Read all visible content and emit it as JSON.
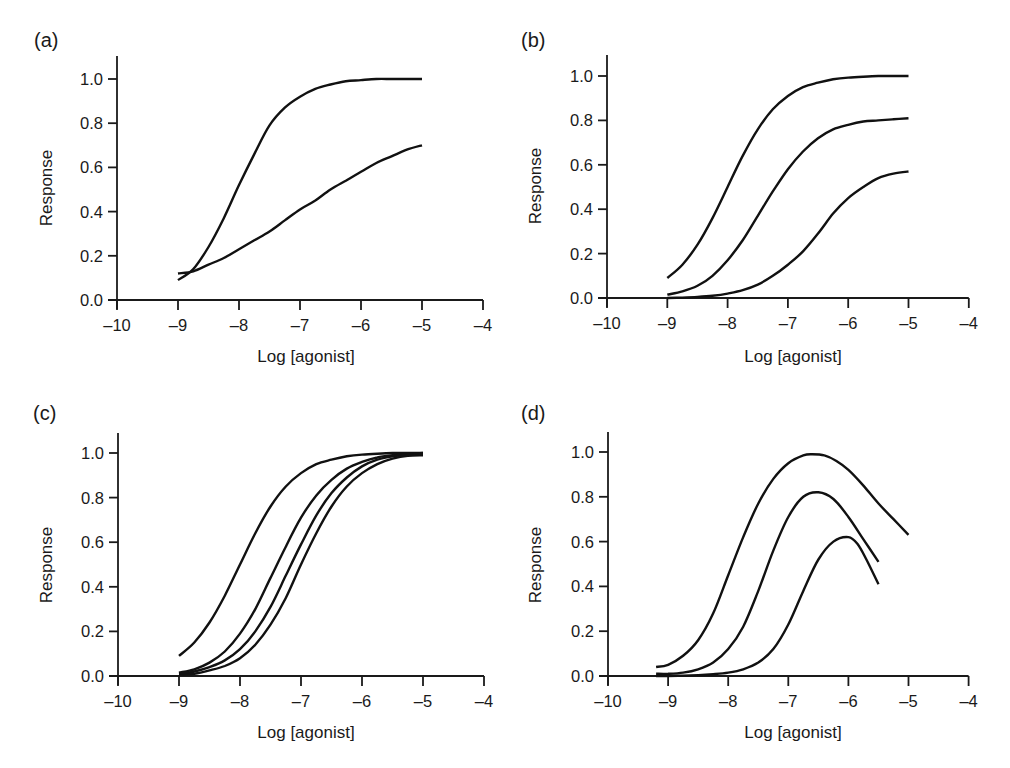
{
  "chart_data": [
    {
      "panel": "(a)",
      "type": "line",
      "xlabel": "Log [agonist]",
      "ylabel": "Response",
      "xlim": [
        -10,
        -4
      ],
      "ylim": [
        0,
        1.1
      ],
      "xticks": [
        "-10",
        "-9",
        "-8",
        "-7",
        "-6",
        "-5",
        "-4"
      ],
      "yticks": [
        "0.0",
        "0.2",
        "0.4",
        "0.6",
        "0.8",
        "1.0"
      ],
      "grid": false,
      "series": [
        {
          "name": "curve-1",
          "x": [
            -9,
            -8.75,
            -8.5,
            -8.25,
            -8,
            -7.75,
            -7.5,
            -7.25,
            -7,
            -6.75,
            -6.5,
            -6.25,
            -6,
            -5.75,
            -5.5,
            -5.25,
            -5
          ],
          "y": [
            0.09,
            0.14,
            0.24,
            0.37,
            0.52,
            0.66,
            0.79,
            0.87,
            0.92,
            0.955,
            0.975,
            0.99,
            0.995,
            1.0,
            1.0,
            1.0,
            1.0
          ]
        },
        {
          "name": "curve-2",
          "x": [
            -9,
            -8.75,
            -8.5,
            -8.25,
            -8,
            -7.75,
            -7.5,
            -7.25,
            -7,
            -6.75,
            -6.5,
            -6.25,
            -6,
            -5.75,
            -5.5,
            -5.25,
            -5
          ],
          "y": [
            0.12,
            0.13,
            0.16,
            0.19,
            0.23,
            0.27,
            0.31,
            0.36,
            0.41,
            0.45,
            0.5,
            0.54,
            0.58,
            0.62,
            0.65,
            0.68,
            0.7
          ]
        }
      ]
    },
    {
      "panel": "(b)",
      "type": "line",
      "xlabel": "Log [agonist]",
      "ylabel": "Response",
      "xlim": [
        -10,
        -4
      ],
      "ylim": [
        0,
        1.1
      ],
      "xticks": [
        "-10",
        "-9",
        "-8",
        "-7",
        "-6",
        "-5",
        "-4"
      ],
      "yticks": [
        "0.0",
        "0.2",
        "0.4",
        "0.6",
        "0.8",
        "1.0"
      ],
      "grid": false,
      "series": [
        {
          "name": "curve-1",
          "x": [
            -9,
            -8.75,
            -8.5,
            -8.25,
            -8,
            -7.75,
            -7.5,
            -7.25,
            -7,
            -6.75,
            -6.5,
            -6.25,
            -6,
            -5.75,
            -5.5,
            -5.25,
            -5
          ],
          "y": [
            0.09,
            0.15,
            0.24,
            0.36,
            0.5,
            0.64,
            0.76,
            0.85,
            0.91,
            0.95,
            0.97,
            0.985,
            0.993,
            0.997,
            1.0,
            1.0,
            1.0
          ]
        },
        {
          "name": "curve-2",
          "x": [
            -9,
            -8.75,
            -8.5,
            -8.25,
            -8,
            -7.75,
            -7.5,
            -7.25,
            -7,
            -6.75,
            -6.5,
            -6.25,
            -6,
            -5.75,
            -5.5,
            -5.25,
            -5
          ],
          "y": [
            0.015,
            0.03,
            0.055,
            0.1,
            0.17,
            0.26,
            0.37,
            0.48,
            0.58,
            0.66,
            0.72,
            0.76,
            0.78,
            0.795,
            0.8,
            0.805,
            0.81
          ]
        },
        {
          "name": "curve-3",
          "x": [
            -9,
            -8.75,
            -8.5,
            -8.25,
            -8,
            -7.75,
            -7.5,
            -7.25,
            -7,
            -6.75,
            -6.5,
            -6.25,
            -6,
            -5.75,
            -5.5,
            -5.25,
            -5
          ],
          "y": [
            0.0,
            0.002,
            0.005,
            0.01,
            0.02,
            0.035,
            0.06,
            0.1,
            0.15,
            0.21,
            0.29,
            0.38,
            0.45,
            0.5,
            0.54,
            0.56,
            0.57
          ]
        }
      ]
    },
    {
      "panel": "(c)",
      "type": "line",
      "xlabel": "Log [agonist]",
      "ylabel": "Response",
      "xlim": [
        -10,
        -4
      ],
      "ylim": [
        0,
        1.1
      ],
      "xticks": [
        "-10",
        "-9",
        "-8",
        "-7",
        "-6",
        "-5",
        "-4"
      ],
      "yticks": [
        "0.0",
        "0.2",
        "0.4",
        "0.6",
        "0.8",
        "1.0"
      ],
      "grid": false,
      "series": [
        {
          "name": "curve-1",
          "x": [
            -9,
            -8.75,
            -8.5,
            -8.25,
            -8,
            -7.75,
            -7.5,
            -7.25,
            -7,
            -6.75,
            -6.5,
            -6.25,
            -6,
            -5.75,
            -5.5,
            -5.25,
            -5
          ],
          "y": [
            0.09,
            0.15,
            0.24,
            0.36,
            0.5,
            0.64,
            0.76,
            0.85,
            0.91,
            0.95,
            0.97,
            0.985,
            0.993,
            0.997,
            1.0,
            1.0,
            1.0
          ]
        },
        {
          "name": "curve-2",
          "x": [
            -9,
            -8.75,
            -8.5,
            -8.25,
            -8,
            -7.75,
            -7.5,
            -7.25,
            -7,
            -6.75,
            -6.5,
            -6.25,
            -6,
            -5.75,
            -5.5,
            -5.25,
            -5
          ],
          "y": [
            0.015,
            0.03,
            0.06,
            0.11,
            0.19,
            0.3,
            0.44,
            0.58,
            0.71,
            0.81,
            0.88,
            0.93,
            0.96,
            0.98,
            0.99,
            0.995,
            1.0
          ]
        },
        {
          "name": "curve-3",
          "x": [
            -9,
            -8.75,
            -8.5,
            -8.25,
            -8,
            -7.75,
            -7.5,
            -7.25,
            -7,
            -6.75,
            -6.5,
            -6.25,
            -6,
            -5.75,
            -5.5,
            -5.25,
            -5
          ],
          "y": [
            0.01,
            0.02,
            0.04,
            0.07,
            0.12,
            0.2,
            0.31,
            0.45,
            0.59,
            0.72,
            0.82,
            0.89,
            0.94,
            0.97,
            0.985,
            0.993,
            0.995
          ]
        },
        {
          "name": "curve-4",
          "x": [
            -9,
            -8.75,
            -8.5,
            -8.25,
            -8,
            -7.75,
            -7.5,
            -7.25,
            -7,
            -6.75,
            -6.5,
            -6.25,
            -6,
            -5.75,
            -5.5,
            -5.25,
            -5
          ],
          "y": [
            0.005,
            0.01,
            0.025,
            0.045,
            0.08,
            0.14,
            0.23,
            0.35,
            0.5,
            0.64,
            0.76,
            0.85,
            0.91,
            0.95,
            0.975,
            0.988,
            0.99
          ]
        }
      ]
    },
    {
      "panel": "(d)",
      "type": "line",
      "xlabel": "Log [agonist]",
      "ylabel": "Response",
      "xlim": [
        -10,
        -4
      ],
      "ylim": [
        0,
        1.1
      ],
      "xticks": [
        "-10",
        "-9",
        "-8",
        "-7",
        "-6",
        "-5",
        "-4"
      ],
      "yticks": [
        "0.0",
        "0.2",
        "0.4",
        "0.6",
        "0.8",
        "1.0"
      ],
      "grid": false,
      "series": [
        {
          "name": "curve-1",
          "x": [
            -9.2,
            -9,
            -8.75,
            -8.5,
            -8.25,
            -8,
            -7.75,
            -7.5,
            -7.25,
            -7,
            -6.75,
            -6.6,
            -6.4,
            -6.2,
            -6,
            -5.75,
            -5.5,
            -5.25,
            -5
          ],
          "y": [
            0.04,
            0.05,
            0.09,
            0.16,
            0.28,
            0.45,
            0.62,
            0.77,
            0.88,
            0.95,
            0.985,
            0.99,
            0.985,
            0.96,
            0.92,
            0.85,
            0.77,
            0.7,
            0.63
          ]
        },
        {
          "name": "curve-2",
          "x": [
            -9.2,
            -9,
            -8.75,
            -8.5,
            -8.25,
            -8,
            -7.75,
            -7.5,
            -7.25,
            -7,
            -6.75,
            -6.5,
            -6.25,
            -6,
            -5.75,
            -5.5
          ],
          "y": [
            0.01,
            0.01,
            0.015,
            0.03,
            0.06,
            0.12,
            0.22,
            0.38,
            0.56,
            0.71,
            0.8,
            0.82,
            0.79,
            0.71,
            0.61,
            0.51
          ]
        },
        {
          "name": "curve-3",
          "x": [
            -9.2,
            -9,
            -8.75,
            -8.5,
            -8.25,
            -8,
            -7.75,
            -7.5,
            -7.25,
            -7,
            -6.75,
            -6.5,
            -6.25,
            -6,
            -5.85,
            -5.7,
            -5.5
          ],
          "y": [
            0.0,
            0.0,
            0.002,
            0.004,
            0.008,
            0.015,
            0.03,
            0.06,
            0.12,
            0.23,
            0.38,
            0.52,
            0.6,
            0.62,
            0.59,
            0.52,
            0.41
          ]
        }
      ]
    }
  ],
  "panels": [
    {
      "label": "(a)",
      "xlabel": "Log [agonist]",
      "ylabel": "Response"
    },
    {
      "label": "(b)",
      "xlabel": "Log [agonist]",
      "ylabel": "Response"
    },
    {
      "label": "(c)",
      "xlabel": "Log [agonist]",
      "ylabel": "Response"
    },
    {
      "label": "(d)",
      "xlabel": "Log [agonist]",
      "ylabel": "Response"
    }
  ]
}
